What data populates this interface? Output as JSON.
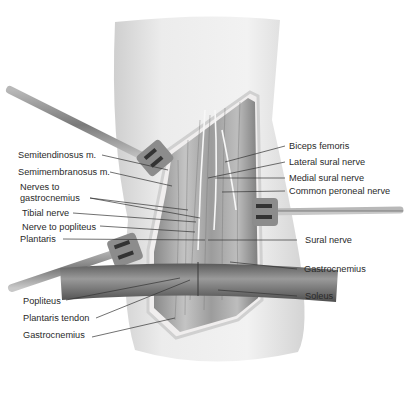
{
  "figure": {
    "type": "anatomical-illustration",
    "colors": {
      "skin": "#e6e6e6",
      "muscle": "#9a9a9a",
      "retractor": "#8c8c8c",
      "strap": "#6a6a6a",
      "leader": "#333333",
      "text": "#2a2a2a"
    }
  },
  "labels": {
    "left": [
      {
        "id": "semitendinosus",
        "text": "Semitendinosus m."
      },
      {
        "id": "semimembranosus",
        "text": "Semimembranosus m."
      },
      {
        "id": "nerves_to_gastrocnemius",
        "text": "Nerves to gastrocnemius"
      },
      {
        "id": "tibial_nerve",
        "text": "Tibial nerve"
      },
      {
        "id": "nerve_to_popliteus",
        "text": "Nerve to popliteus"
      },
      {
        "id": "plantaris",
        "text": "Plantaris"
      },
      {
        "id": "popliteus",
        "text": "Popliteus"
      },
      {
        "id": "plantaris_tendon",
        "text": "Plantaris tendon"
      },
      {
        "id": "gastrocnemius_left",
        "text": "Gastrocnemius"
      }
    ],
    "right": [
      {
        "id": "biceps_femoris",
        "text": "Biceps femoris"
      },
      {
        "id": "lateral_sural_nerve",
        "text": "Lateral sural nerve"
      },
      {
        "id": "medial_sural_nerve",
        "text": "Medial sural nerve"
      },
      {
        "id": "common_peroneal_nerve",
        "text": "Common peroneal nerve"
      },
      {
        "id": "sural_nerve",
        "text": "Sural nerve"
      },
      {
        "id": "gastrocnemius_right",
        "text": "Gastrocnemius"
      },
      {
        "id": "soleus",
        "text": "Soleus"
      }
    ]
  }
}
